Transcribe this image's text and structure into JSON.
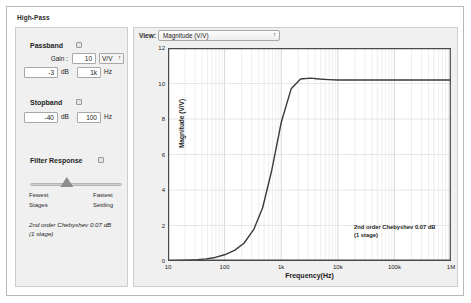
{
  "window": {
    "title": "High-Pass"
  },
  "passband": {
    "title": "Passband",
    "help_icon": "help-icon",
    "gain_label": "Gain :",
    "gain_value": "10",
    "gain_unit": "V/V",
    "ripple_value": "-3",
    "ripple_unit": "dB",
    "frequency_value": "1k",
    "frequency_unit": "Hz"
  },
  "stopband": {
    "title": "Stopband",
    "help_icon": "help-icon",
    "attenuation_value": "-40",
    "attenuation_unit": "dB",
    "frequency_value": "100",
    "frequency_unit": "Hz"
  },
  "filter_response": {
    "title": "Filter Response",
    "help_icon": "help-icon",
    "left_label_line1": "Fewest",
    "left_label_line2": "Stages",
    "right_label_line1": "Fastest",
    "right_label_line2": "Settling",
    "slider_position_percent": 40,
    "note_line1": "2nd order Chebyshev 0.07 dB",
    "note_line2": "(1 stage)"
  },
  "chart_panel": {
    "view_label": "View:",
    "view_selected": "Magnitude (V/V)",
    "stepper_icon": "chevron-updown-icon",
    "annotation_line1": "2nd order Chebyshev 0.07 dB",
    "annotation_line2": "(1 stage)"
  },
  "chart_data": {
    "type": "line",
    "title": "",
    "xlabel": "Frequency(Hz)",
    "ylabel": "Magnitude (V/V)",
    "xscale": "log",
    "xlim": [
      10,
      1000000
    ],
    "ylim": [
      0,
      12
    ],
    "yticks": [
      0,
      2,
      4,
      6,
      8,
      10,
      12
    ],
    "xticks": [
      10,
      100,
      1000,
      10000,
      100000,
      1000000
    ],
    "xtick_labels": [
      "10",
      "100",
      "1k",
      "10k",
      "100k",
      "1M"
    ],
    "grid": true,
    "legend": false,
    "annotations": [
      "2nd order Chebyshev 0.07 dB",
      "(1 stage)"
    ],
    "series": [
      {
        "name": "Magnitude (V/V)",
        "color": "#3a3a3a",
        "x": [
          10,
          15,
          22,
          33,
          47,
          68,
          100,
          150,
          220,
          330,
          470,
          680,
          1000,
          1500,
          2200,
          3300,
          4700,
          6800,
          10000,
          22000,
          47000,
          100000,
          220000,
          470000,
          1000000
        ],
        "y": [
          0.02,
          0.03,
          0.05,
          0.08,
          0.12,
          0.2,
          0.35,
          0.6,
          1.0,
          1.8,
          3.0,
          5.1,
          7.8,
          9.7,
          10.25,
          10.3,
          10.25,
          10.22,
          10.2,
          10.2,
          10.2,
          10.2,
          10.2,
          10.2,
          10.2
        ]
      }
    ]
  }
}
